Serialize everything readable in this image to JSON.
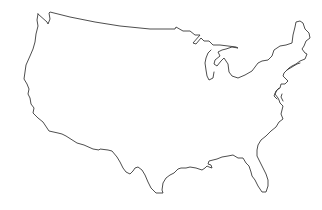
{
  "map": {
    "title": "",
    "subject": "Contiguous United States outline",
    "background_color": "#ffffff",
    "stroke_color": "#3a3a3a",
    "stroke_width": 0.9,
    "regions": [
      {
        "name": "mainland-outline"
      },
      {
        "name": "lake-michigan-shore"
      },
      {
        "name": "delmarva-chesapeake"
      }
    ]
  }
}
